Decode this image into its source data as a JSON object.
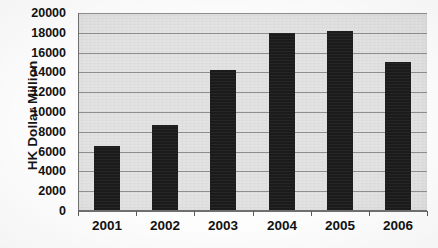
{
  "chart_data": {
    "type": "bar",
    "title": "",
    "xlabel": "",
    "ylabel": "HK Dollar Million",
    "categories": [
      "2001",
      "2002",
      "2003",
      "2004",
      "2005",
      "2006"
    ],
    "values": [
      6600,
      8700,
      14200,
      18000,
      18200,
      15100
    ],
    "ylim": [
      0,
      20000
    ],
    "ytick_step": 2000,
    "yticks": [
      "20000",
      "18000",
      "16000",
      "14000",
      "12000",
      "10000",
      "8000",
      "6000",
      "4000",
      "2000",
      "0"
    ],
    "ytick_values": [
      20000,
      18000,
      16000,
      14000,
      12000,
      10000,
      8000,
      6000,
      4000,
      2000,
      0
    ],
    "grid": true,
    "grid_axis": "y",
    "legend": false,
    "legend_position": "none",
    "series": [
      {
        "name": "HK Dollar Million",
        "values": [
          6600,
          8700,
          14200,
          18000,
          18200,
          15100
        ]
      }
    ],
    "colors": {
      "bar": "#1c1c1c",
      "plot_background": "#e2e2e2",
      "gridline": "#8e8e8e",
      "axis": "#6f6f6f",
      "text": "#111111",
      "page_background": "#fdfdfd"
    }
  }
}
